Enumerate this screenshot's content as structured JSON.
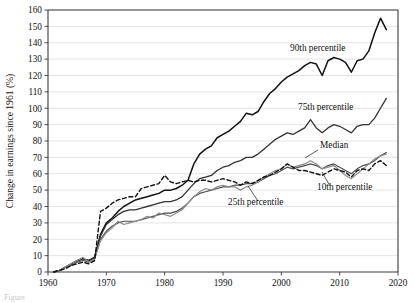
{
  "figure": {
    "caption_fragment": "Figure"
  },
  "chart_data": {
    "type": "line",
    "title": "",
    "xlabel": "",
    "ylabel": "Change in earnings since 1961 (%)",
    "xlim": [
      1960,
      2020
    ],
    "ylim": [
      0,
      160
    ],
    "xticks": [
      1960,
      1970,
      1980,
      1990,
      2000,
      2010,
      2020
    ],
    "yticks": [
      0,
      10,
      20,
      30,
      40,
      50,
      60,
      70,
      80,
      90,
      100,
      110,
      120,
      130,
      140,
      150,
      160
    ],
    "grid": true,
    "legend_position": "inline-annotations",
    "x": [
      1961,
      1962,
      1963,
      1964,
      1965,
      1966,
      1967,
      1968,
      1969,
      1970,
      1971,
      1972,
      1973,
      1974,
      1975,
      1976,
      1977,
      1978,
      1979,
      1980,
      1981,
      1982,
      1983,
      1984,
      1985,
      1986,
      1987,
      1988,
      1989,
      1990,
      1991,
      1992,
      1993,
      1994,
      1995,
      1996,
      1997,
      1998,
      1999,
      2000,
      2001,
      2002,
      2003,
      2004,
      2005,
      2006,
      2007,
      2008,
      2009,
      2010,
      2011,
      2012,
      2013,
      2014,
      2015,
      2016,
      2017,
      2018
    ],
    "series": [
      {
        "name": "90th percentile",
        "color": "#111111",
        "style": "solid",
        "width": 1.5,
        "annotation": "90th percentile",
        "values": [
          0,
          1,
          3,
          5,
          7,
          8,
          7,
          9,
          23,
          30,
          33,
          37,
          40,
          42,
          44,
          45,
          46,
          47,
          48,
          50,
          50,
          51,
          53,
          56,
          66,
          72,
          75,
          77,
          82,
          84,
          86,
          89,
          92,
          97,
          96,
          98,
          104,
          109,
          112,
          116,
          119,
          121,
          123,
          126,
          128,
          127,
          120,
          129,
          131,
          130,
          128,
          122,
          129,
          130,
          135,
          146,
          155,
          148
        ]
      },
      {
        "name": "75th percentile",
        "color": "#333333",
        "style": "solid",
        "width": 1.3,
        "annotation": "75th percentile",
        "values": [
          0,
          1,
          3,
          5,
          7,
          8,
          7,
          9,
          22,
          29,
          32,
          35,
          37,
          38,
          38,
          39,
          40,
          41,
          42,
          43,
          43,
          44,
          46,
          50,
          54,
          57,
          58,
          59,
          62,
          64,
          65,
          67,
          68,
          70,
          70,
          72,
          75,
          78,
          81,
          83,
          85,
          84,
          86,
          88,
          93,
          88,
          85,
          88,
          90,
          89,
          87,
          85,
          89,
          90,
          90,
          94,
          100,
          106
        ]
      },
      {
        "name": "Median",
        "color": "#4d4d4d",
        "style": "solid",
        "width": 1.2,
        "annotation": "Median",
        "values": [
          0,
          1,
          3,
          4,
          6,
          7,
          6,
          8,
          20,
          25,
          28,
          30,
          31,
          31,
          31,
          32,
          33,
          34,
          35,
          36,
          36,
          37,
          39,
          42,
          46,
          48,
          49,
          50,
          51,
          52,
          52,
          53,
          53,
          54,
          54,
          55,
          57,
          59,
          60,
          62,
          64,
          63,
          64,
          65,
          66,
          65,
          63,
          65,
          66,
          64,
          62,
          60,
          63,
          65,
          66,
          68,
          71,
          73
        ]
      },
      {
        "name": "25th percentile",
        "color": "#8c8c8c",
        "style": "solid",
        "width": 1.2,
        "annotation": "25th percentile",
        "values": [
          0,
          1,
          3,
          5,
          7,
          9,
          6,
          8,
          19,
          24,
          27,
          31,
          29,
          30,
          31,
          32,
          34,
          33,
          36,
          35,
          34,
          36,
          38,
          42,
          46,
          49,
          51,
          50,
          52,
          53,
          52,
          52,
          50,
          52,
          53,
          55,
          58,
          60,
          62,
          63,
          66,
          64,
          65,
          66,
          68,
          66,
          63,
          64,
          65,
          62,
          59,
          57,
          60,
          63,
          66,
          69,
          71,
          72
        ]
      },
      {
        "name": "10th percentile",
        "color": "#111111",
        "style": "dashed",
        "width": 1.4,
        "annotation": "10th percentile",
        "values": [
          0,
          1,
          2,
          4,
          5,
          6,
          5,
          7,
          37,
          39,
          42,
          44,
          45,
          46,
          46,
          51,
          52,
          53,
          54,
          59,
          55,
          54,
          55,
          56,
          55,
          56,
          56,
          55,
          56,
          57,
          56,
          55,
          53,
          55,
          54,
          56,
          58,
          59,
          61,
          63,
          66,
          64,
          62,
          62,
          61,
          60,
          59,
          61,
          63,
          62,
          61,
          58,
          62,
          63,
          62,
          66,
          68,
          65
        ]
      }
    ],
    "annotations": [
      {
        "text": "90th percentile",
        "x": 290,
        "y": 51,
        "leader": false
      },
      {
        "text": "75th percentile",
        "x": 298,
        "y": 110,
        "leader": false
      },
      {
        "text": "Median",
        "x": 320,
        "y": 148,
        "leader": true
      },
      {
        "text": "10th percentile",
        "x": 317,
        "y": 190,
        "leader": true
      },
      {
        "text": "25th percentile",
        "x": 228,
        "y": 205,
        "leader": true
      }
    ]
  }
}
